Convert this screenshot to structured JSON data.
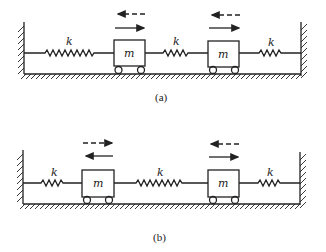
{
  "figure": {
    "panels": [
      {
        "id": "a",
        "caption": "(a)",
        "springs": [
          {
            "label": "k"
          },
          {
            "label": "k"
          },
          {
            "label": "k"
          }
        ],
        "masses": [
          {
            "label": "m",
            "dashed_arrow": "left",
            "solid_arrow": "right"
          },
          {
            "label": "m",
            "dashed_arrow": "left",
            "solid_arrow": "right"
          }
        ],
        "mode": "in-phase"
      },
      {
        "id": "b",
        "caption": "(b)",
        "springs": [
          {
            "label": "k"
          },
          {
            "label": "k"
          },
          {
            "label": "k"
          }
        ],
        "masses": [
          {
            "label": "m",
            "dashed_arrow": "right",
            "solid_arrow": "left"
          },
          {
            "label": "m",
            "dashed_arrow": "left",
            "solid_arrow": "right"
          }
        ],
        "mode": "out-of-phase"
      }
    ],
    "colors": {
      "ink": "#222222",
      "background": "#ffffff"
    }
  }
}
